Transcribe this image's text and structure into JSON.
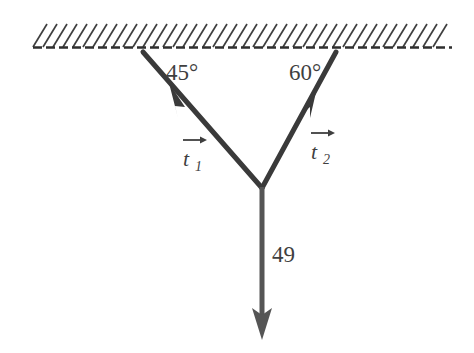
{
  "figure": {
    "background_color": "#ffffff",
    "line_color": "#3f3f3f",
    "ceiling": {
      "name": "hatched-ceiling",
      "baseline_y": 47,
      "x_start": 33,
      "x_end": 452,
      "dashed": true,
      "hatch_count": 41,
      "hatch_angle_deg": 60
    },
    "labels": {
      "angle_left": "45°",
      "angle_right": "60°",
      "tension_left_letter": "t",
      "tension_left_subscript": "1",
      "tension_right_letter": "t",
      "tension_right_subscript": "2",
      "weight": "49"
    },
    "geometry": {
      "junction_x": 262,
      "junction_y": 187,
      "left_anchor_x": 143,
      "left_anchor_y": 52,
      "right_anchor_x": 336,
      "right_anchor_y": 52,
      "weight_tip_x": 262,
      "weight_tip_y": 338
    }
  }
}
